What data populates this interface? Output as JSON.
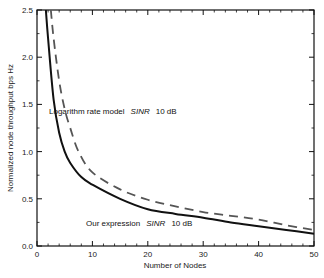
{
  "chart_data": {
    "type": "line",
    "title": "",
    "xlabel": "Number of Nodes",
    "ylabel": "Normalized node throughput bps Hz",
    "xlim": [
      0,
      50
    ],
    "ylim": [
      0,
      2.5
    ],
    "xticks": [
      0,
      10,
      20,
      30,
      40,
      50
    ],
    "xtick_labels": [
      "0",
      "10",
      "20",
      "30",
      "40",
      "50"
    ],
    "yticks": [
      0.0,
      0.5,
      1.0,
      1.5,
      2.0,
      2.5
    ],
    "ytick_labels": [
      "0.0",
      "0.5",
      "1.0",
      "1.5",
      "2.0",
      "2.5"
    ],
    "grid": false,
    "legend": "none (inline annotations)",
    "series": [
      {
        "name": "Our expression SINR 10 dB",
        "style": "solid",
        "color": "#111111",
        "x": [
          1.6,
          2,
          3,
          4,
          5,
          6,
          8,
          10,
          15,
          20,
          25,
          30,
          35,
          40,
          45,
          50
        ],
        "y": [
          2.5,
          2.2,
          1.55,
          1.2,
          1.0,
          0.88,
          0.73,
          0.65,
          0.5,
          0.39,
          0.34,
          0.3,
          0.25,
          0.21,
          0.17,
          0.13
        ]
      },
      {
        "name": "Logarithm rate model SINR 10 dB",
        "style": "dashed",
        "color": "#555555",
        "x": [
          2.5,
          3,
          4,
          5,
          6,
          7.5,
          10,
          15,
          20,
          25,
          30,
          35,
          40,
          45,
          50
        ],
        "y": [
          2.5,
          2.2,
          1.75,
          1.45,
          1.25,
          1.0,
          0.78,
          0.6,
          0.49,
          0.42,
          0.36,
          0.32,
          0.28,
          0.22,
          0.17
        ]
      }
    ],
    "annotations": [
      {
        "text_parts": [
          "Logarithm rate model ",
          "SINR",
          "  10 dB"
        ],
        "x": 2.2,
        "y": 1.47
      },
      {
        "text_parts": [
          "Our expression ",
          "SINR",
          "  10 dB"
        ],
        "x": 8.5,
        "y": 0.29
      }
    ]
  },
  "labels": {
    "xlabel": "Number of Nodes",
    "ylabel": "Normalized node throughput bps Hz",
    "annot_log_1": "Logarithm rate model",
    "annot_log_2": "SINR",
    "annot_log_3": "10 dB",
    "annot_our_1": "Our expression",
    "annot_our_2": "SINR",
    "annot_our_3": "10 dB"
  }
}
